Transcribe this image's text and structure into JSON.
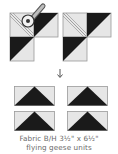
{
  "diagram": {
    "colors": {
      "light_fabric": "#e6e6e6",
      "dark_fabric": "#1a1a1a",
      "outline": "#9a9a9a",
      "seam": "#8c8c8c",
      "caption_text": "#6a6a6a"
    },
    "steps": [
      {
        "name": "sew-and-trim",
        "description": "Two L-shaped units with stitched diagonals; rotary cutter trimming"
      },
      {
        "name": "result",
        "description": "Four flying geese units"
      }
    ],
    "arrow": "↓",
    "caption": {
      "line1": "Fabric B/H 3½\" x 6½\"",
      "line2": "flying geese units"
    }
  }
}
